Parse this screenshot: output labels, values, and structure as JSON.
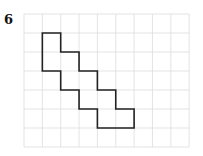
{
  "problem_number": "6",
  "grid": {
    "cols": 9,
    "rows": 7,
    "x0": 24,
    "y0": 14,
    "cw": 18.35,
    "ch": 19,
    "line_color": "#dcdcdc"
  },
  "shape": {
    "stroke": "#222222",
    "vertices": [
      [
        1,
        1
      ],
      [
        2,
        1
      ],
      [
        2,
        2
      ],
      [
        3,
        2
      ],
      [
        3,
        3
      ],
      [
        4,
        3
      ],
      [
        4,
        4
      ],
      [
        5,
        4
      ],
      [
        5,
        5
      ],
      [
        6,
        5
      ],
      [
        6,
        6
      ],
      [
        4,
        6
      ],
      [
        4,
        5
      ],
      [
        3,
        5
      ],
      [
        3,
        4
      ],
      [
        2,
        4
      ],
      [
        2,
        3
      ],
      [
        1,
        3
      ]
    ]
  }
}
